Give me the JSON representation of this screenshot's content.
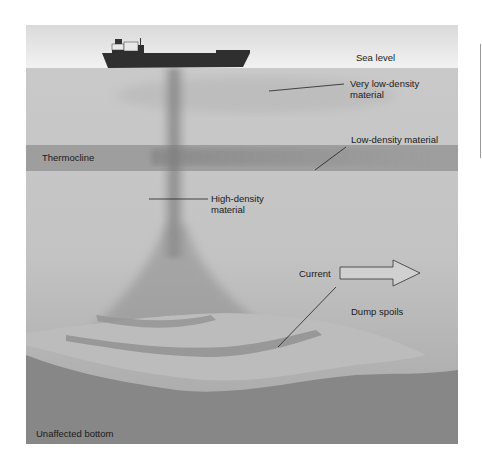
{
  "diagram": {
    "labels": {
      "sea_level": "Sea level",
      "very_low_density_line1": "Very low-density",
      "very_low_density_line2": "material",
      "low_density": "Low-density material",
      "thermocline": "Thermocline",
      "high_density_line1": "High-density",
      "high_density_line2": "material",
      "current": "Current",
      "dump_spoils": "Dump spoils",
      "unaffected_bottom": "Unaffected bottom"
    },
    "icons": {
      "ship": "ship-icon",
      "current_arrow": "right-arrow-icon"
    },
    "colors": {
      "sky": "#e6e6e6",
      "water": "#c4c4c4",
      "thermocline": "#9c9c9c",
      "plume": "#8c8c8c",
      "seabed": "#8a8a8a",
      "spoils_mound": "#bdbdbd",
      "ship_hull": "#2f2f2f"
    }
  }
}
